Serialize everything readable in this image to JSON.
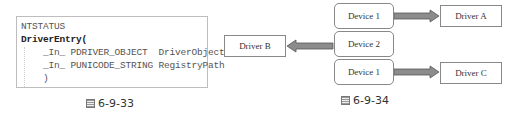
{
  "figure_33": {
    "caption": "6-9-33",
    "code_lines": [
      "NTSTATUS",
      "DriverEntry(",
      "    _In_ PDRIVER_OBJECT  DriverObject,",
      "    _In_ PUNICODE_STRING RegistryPath",
      "    )"
    ]
  },
  "figure_34": {
    "caption": "6-9-34",
    "devices": [
      {
        "label": "Device 1"
      },
      {
        "label": "Device 2"
      },
      {
        "label": "Device 1"
      }
    ],
    "drivers": [
      {
        "label": "Driver A"
      },
      {
        "label": "Driver B"
      },
      {
        "label": "Driver C"
      }
    ],
    "arrow_color": "#8c8c8c"
  }
}
